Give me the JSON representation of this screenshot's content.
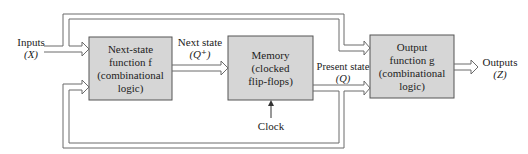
{
  "diagram": {
    "type": "sequential-circuit-block-diagram",
    "colors": {
      "block_fill": "#d6d6d6",
      "block_stroke": "#555555",
      "wire": "#6b6b6b",
      "text": "#222222"
    },
    "blocks": [
      {
        "id": "next-state-function",
        "lines": [
          "Next-state",
          "function f",
          "(combinational",
          "logic)"
        ]
      },
      {
        "id": "memory",
        "lines": [
          "Memory",
          "(clocked",
          "flip-flops)"
        ]
      },
      {
        "id": "output-function",
        "lines": [
          "Output",
          "function g",
          "(combinational",
          "logic)"
        ]
      }
    ],
    "labels": {
      "inputs": "Inputs",
      "inputs_symbol": "(X)",
      "next_state": "Next state",
      "next_state_symbol": "(Q⁺)",
      "present_state": "Present state",
      "present_state_symbol": "(Q)",
      "outputs": "Outputs",
      "outputs_symbol": "(Z)",
      "clock": "Clock"
    },
    "connections": [
      {
        "from": "Inputs (X)",
        "to": "next-state-function"
      },
      {
        "from": "Inputs (X)",
        "to": "output-function"
      },
      {
        "from": "next-state-function",
        "to": "memory",
        "label": "Next state (Q⁺)"
      },
      {
        "from": "memory",
        "to": "output-function",
        "label": "Present state (Q)"
      },
      {
        "from": "memory",
        "to": "next-state-function",
        "label": "feedback"
      },
      {
        "from": "Clock",
        "to": "memory"
      },
      {
        "from": "output-function",
        "to": "Outputs (Z)"
      }
    ]
  }
}
